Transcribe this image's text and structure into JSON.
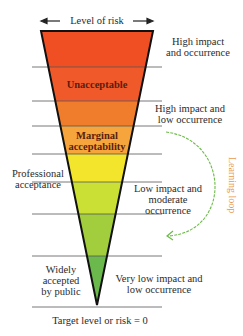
{
  "header": {
    "title": "Level of risk"
  },
  "funnel": {
    "bands": [
      {
        "name": "band-1",
        "color": "#f04f24"
      },
      {
        "name": "band-unacceptable",
        "color": "#f05a2a",
        "label": "Unacceptable"
      },
      {
        "name": "band-3",
        "color": "#f07d2c"
      },
      {
        "name": "band-marginal",
        "color": "#f6a53c",
        "label": "Marginal acceptability"
      },
      {
        "name": "band-yellow",
        "color": "#f3e52c"
      },
      {
        "name": "band-yellowgreen",
        "color": "#cbe034"
      },
      {
        "name": "band-green",
        "color": "#a2cd3c"
      },
      {
        "name": "band-darkgreen",
        "color": "#6bb84c"
      }
    ],
    "inner_labels": {
      "unacceptable": "Unacceptable",
      "marginal_1": "Marginal",
      "marginal_2": "acceptability"
    }
  },
  "right_labels": {
    "high_impact_occurrence_1": "High impact",
    "high_impact_occurrence_2": "and occurrence",
    "high_impact_low_1": "High impact and",
    "high_impact_low_2": "low occurrence",
    "low_impact_1": "Low impact and",
    "low_impact_2": "moderate",
    "low_impact_3": "occurrence",
    "very_low_1": "Very low impact and",
    "very_low_2": "low occurrence"
  },
  "left_labels": {
    "professional_1": "Professional",
    "professional_2": "acceptance",
    "public_1": "Widely",
    "public_2": "accepted",
    "public_3": "by public"
  },
  "learning_loop": {
    "label": "Learning loop",
    "color": "#6dbb4a",
    "text_color": "#e89a50"
  },
  "footer": {
    "caption": "Target level or risk = 0"
  }
}
